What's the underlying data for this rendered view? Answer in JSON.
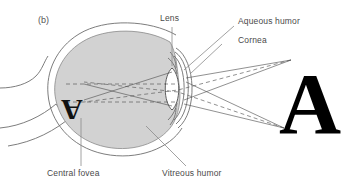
{
  "figure": {
    "panel_tag": "(b)",
    "background_color": "#ffffff",
    "line_color": "#6b6b6b",
    "fill_color": "#d4d4d4",
    "text_color": "#4a4a4a"
  },
  "labels": {
    "lens": "Lens",
    "aqueous_humor": "Aqueous humor",
    "cornea": "Cornea",
    "central_fovea": "Central fovea",
    "vitreous_humor": "Vitreous humor"
  },
  "objects": {
    "external_letter": "A",
    "retinal_image_letter": "A"
  }
}
